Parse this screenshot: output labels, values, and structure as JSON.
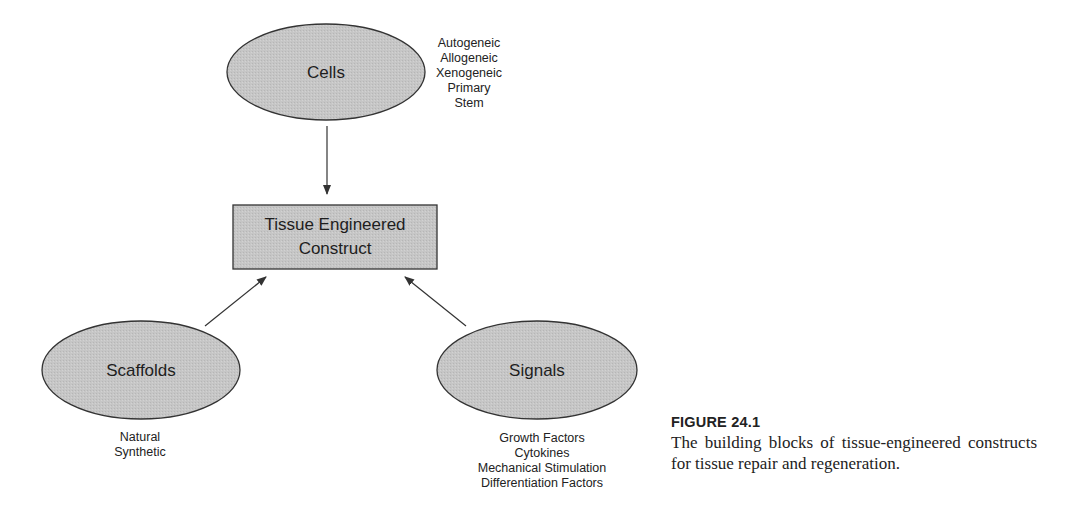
{
  "diagram": {
    "center": {
      "label_line1": "Tissue Engineered",
      "label_line2": "Construct"
    },
    "nodes": {
      "cells": {
        "label": "Cells",
        "items": [
          "Autogeneic",
          "Allogeneic",
          "Xenogeneic",
          "Primary",
          "Stem"
        ]
      },
      "scaffolds": {
        "label": "Scaffolds",
        "items": [
          "Natural",
          "Synthetic"
        ]
      },
      "signals": {
        "label": "Signals",
        "items": [
          "Growth Factors",
          "Cytokines",
          "Mechanical Stimulation",
          "Differentiation Factors"
        ]
      }
    },
    "colors": {
      "fill": "#c4c4c4",
      "stroke": "#333333"
    }
  },
  "caption": {
    "figure_number": "FIGURE 24.1",
    "text": "The building blocks of tissue-engineered constructs for tissue repair and regeneration."
  }
}
